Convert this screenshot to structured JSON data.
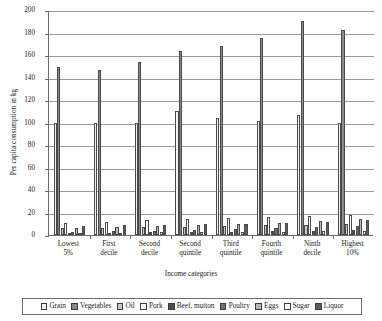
{
  "chart_data": {
    "type": "bar",
    "title": "",
    "xlabel": "Income categories",
    "ylabel": "Per capita consumption in kg",
    "ylim": [
      0,
      200
    ],
    "yticks": [
      0,
      20,
      40,
      60,
      80,
      100,
      120,
      140,
      160,
      180,
      200
    ],
    "ytick_labels": [
      "0",
      "20",
      "40",
      "60",
      "80",
      "100",
      "120",
      "140",
      "160",
      "180",
      "200"
    ],
    "grid": true,
    "legend_position": "bottom",
    "categories": [
      "Lowest 5%",
      "First decile",
      "Second decile",
      "Second quintile",
      "Third quintile",
      "Fourth quintile",
      "Ninth decile",
      "Highest 10%"
    ],
    "series": [
      {
        "name": "Grain",
        "color": "#f2f2f2",
        "values": [
          100,
          100,
          100,
          110,
          104,
          101,
          107,
          100
        ]
      },
      {
        "name": "Vegetables",
        "color": "#8a8a8a",
        "values": [
          149,
          147,
          154,
          164,
          168,
          175,
          190,
          182
        ]
      },
      {
        "name": "Oil",
        "color": "#c9c9c9",
        "values": [
          6,
          6.5,
          7,
          7.5,
          8,
          8.5,
          9,
          9.5
        ]
      },
      {
        "name": "Pork",
        "color": "#ffffff",
        "values": [
          11,
          12,
          13,
          14,
          15,
          16,
          17,
          18
        ]
      },
      {
        "name": "Beef, mutton",
        "color": "#4d4d4d",
        "values": [
          2,
          2.2,
          2.5,
          2.8,
          3,
          3.4,
          3.8,
          4.2
        ]
      },
      {
        "name": "Poultry",
        "color": "#707070",
        "values": [
          3,
          3.4,
          4,
          4.6,
          5.2,
          6,
          7,
          8
        ]
      },
      {
        "name": "Eggs",
        "color": "#b5b5b5",
        "values": [
          6,
          7,
          8,
          9,
          10,
          11,
          12.5,
          14
        ]
      },
      {
        "name": "Sugar",
        "color": "#ffffff",
        "values": [
          2,
          2.2,
          2.4,
          2.6,
          2.8,
          3,
          3.2,
          3.4
        ]
      },
      {
        "name": "Liquor",
        "color": "#5e5e5e",
        "values": [
          8,
          8.5,
          9,
          9.5,
          10,
          11,
          12,
          13
        ]
      }
    ]
  },
  "axis": {
    "y_title": "Per capita consumption in kg",
    "x_title": "Income categories"
  },
  "category_lines": [
    [
      "Lowest",
      "5%"
    ],
    [
      "First",
      "decile"
    ],
    [
      "Second",
      "decile"
    ],
    [
      "Second",
      "quintile"
    ],
    [
      "Third",
      "quintile"
    ],
    [
      "Fourth",
      "quintile"
    ],
    [
      "Ninth",
      "decile"
    ],
    [
      "Highest",
      "10%"
    ]
  ]
}
